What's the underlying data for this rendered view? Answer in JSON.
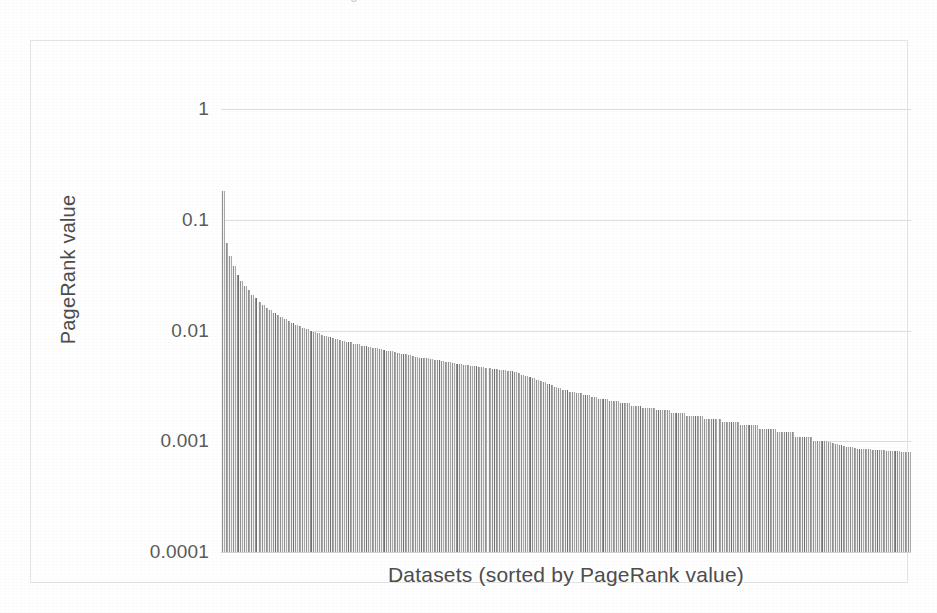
{
  "page": {
    "top_cropped_text": "PageRank value distribution across datasets"
  },
  "chart": {
    "xaxis_title": "Datasets (sorted by PageRank value)",
    "yaxis_title": "PageRank value",
    "ytick_labels": [
      "1",
      "0.1",
      "0.01",
      "0.001",
      "0.0001"
    ],
    "bar_color": "#b0b0b0",
    "gridline_color": "#dedede",
    "frame_color": "#e4e4e4",
    "text_color": "#4d4d4d"
  },
  "chart_data": {
    "type": "bar",
    "title": "",
    "xlabel": "Datasets (sorted by PageRank value)",
    "ylabel": "PageRank value",
    "yscale": "log",
    "ylim": [
      0.0001,
      1
    ],
    "yticks": [
      0.0001,
      0.001,
      0.01,
      0.1,
      1
    ],
    "ytick_labels": [
      "0.0001",
      "0.001",
      "0.01",
      "0.1",
      "1"
    ],
    "grid": true,
    "legend": null,
    "xtick_labels": [],
    "series_name": "PageRank value",
    "n_bars": 178,
    "values": [
      0.18,
      0.062,
      0.047,
      0.038,
      0.032,
      0.028,
      0.025,
      0.023,
      0.021,
      0.0195,
      0.0182,
      0.0171,
      0.0161,
      0.0152,
      0.0145,
      0.0138,
      0.0132,
      0.0126,
      0.0121,
      0.0117,
      0.0113,
      0.0109,
      0.0106,
      0.0103,
      0.01,
      0.0097,
      0.0095,
      0.0092,
      0.009,
      0.0088,
      0.0086,
      0.0084,
      0.0082,
      0.0081,
      0.0079,
      0.0078,
      0.0076,
      0.0075,
      0.0073,
      0.0072,
      0.0071,
      0.007,
      0.0069,
      0.0068,
      0.0067,
      0.0066,
      0.0065,
      0.0064,
      0.0063,
      0.0062,
      0.0061,
      0.006,
      0.0059,
      0.0058,
      0.0057,
      0.0057,
      0.0056,
      0.0055,
      0.0054,
      0.0054,
      0.0053,
      0.0052,
      0.0052,
      0.0051,
      0.005,
      0.005,
      0.0049,
      0.0049,
      0.0048,
      0.0048,
      0.0047,
      0.0047,
      0.0046,
      0.0046,
      0.0045,
      0.0045,
      0.0044,
      0.0044,
      0.0043,
      0.0043,
      0.0042,
      0.0041,
      0.004,
      0.0039,
      0.0038,
      0.0037,
      0.0036,
      0.0035,
      0.0034,
      0.0033,
      0.0032,
      0.0031,
      0.003,
      0.0029,
      0.0029,
      0.0028,
      0.0028,
      0.0027,
      0.0027,
      0.0026,
      0.0026,
      0.0025,
      0.0025,
      0.0024,
      0.0024,
      0.0024,
      0.0023,
      0.0023,
      0.0023,
      0.0022,
      0.0022,
      0.0022,
      0.0021,
      0.0021,
      0.0021,
      0.002,
      0.002,
      0.002,
      0.002,
      0.0019,
      0.0019,
      0.0019,
      0.0019,
      0.0018,
      0.0018,
      0.0018,
      0.0018,
      0.0017,
      0.0017,
      0.0017,
      0.0017,
      0.0017,
      0.0016,
      0.0016,
      0.0016,
      0.0016,
      0.0016,
      0.0015,
      0.0015,
      0.0015,
      0.0015,
      0.0015,
      0.0014,
      0.0014,
      0.0014,
      0.0014,
      0.0014,
      0.0013,
      0.0013,
      0.0013,
      0.0013,
      0.0013,
      0.0012,
      0.0012,
      0.0012,
      0.0012,
      0.0012,
      0.0011,
      0.0011,
      0.0011,
      0.0011,
      0.0011,
      0.001,
      0.001,
      0.001,
      0.001,
      0.00098,
      0.00096,
      0.00094,
      0.00092,
      0.0009,
      0.00089,
      0.00088,
      0.00087,
      0.00086,
      0.00086,
      0.00085,
      0.00085,
      0.00084,
      0.00084,
      0.00083,
      0.00083,
      0.00082,
      0.00082,
      0.00081,
      0.00081,
      0.0008,
      0.0008,
      0.0008
    ]
  }
}
